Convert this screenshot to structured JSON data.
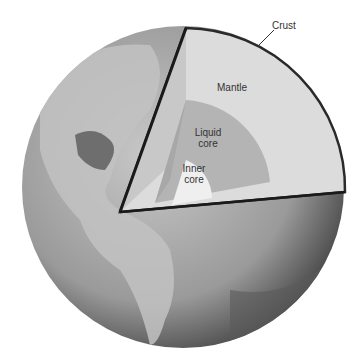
{
  "diagram": {
    "labels": {
      "crust": "Crust",
      "mantle": "Mantle",
      "liquid_core_1": "Liquid",
      "liquid_core_2": "core",
      "inner_core_1": "Inner",
      "inner_core_2": "core"
    },
    "colors": {
      "ocean": "#8a8a8a",
      "land": "#b8b8b8",
      "mantle": "#dcdcdc",
      "liquid_core": "#b4b4b4",
      "inner_core": "#efefef",
      "crust_edge": "#3a3a3a"
    }
  }
}
